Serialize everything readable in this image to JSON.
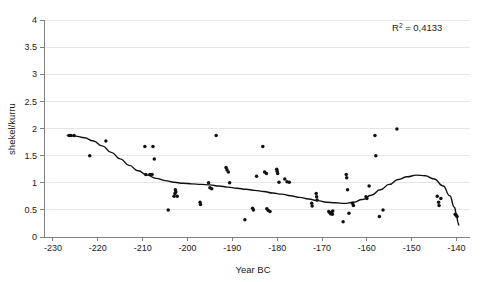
{
  "chart_data": {
    "type": "scatter",
    "title": "",
    "xlabel": "Year BC",
    "ylabel": "shekel/kurru",
    "xlim": [
      -232,
      -137
    ],
    "ylim": [
      0,
      4
    ],
    "xticks": [
      -230,
      -220,
      -210,
      -200,
      -190,
      -180,
      -170,
      -160,
      -150,
      -140
    ],
    "xtick_labels": [
      "-230",
      "-220",
      "-210",
      "-200",
      "-190",
      "-180",
      "-170",
      "-160",
      "-150",
      "-140"
    ],
    "yticks": [
      0,
      0.5,
      1,
      1.5,
      2,
      2.5,
      3,
      3.5,
      4
    ],
    "ytick_labels": [
      "0",
      "0.5",
      "1",
      "1.5",
      "2",
      "2.5",
      "3",
      "3.5",
      "4"
    ],
    "grid": "horizontal",
    "legend": "none",
    "annotations": [
      {
        "name": "r-squared",
        "text_prefix": "R",
        "text_sup": "2",
        "text_suffix": " = 0,4133",
        "full_text": "R2 = 0,4133",
        "value": 0.4133,
        "x": -152,
        "y": 3.72
      }
    ],
    "series": [
      {
        "name": "Barley price observations",
        "marker": "dot",
        "color": "#111111",
        "points": [
          [
            -226.4,
            1.87
          ],
          [
            -226.0,
            1.87
          ],
          [
            -225.3,
            1.87
          ],
          [
            -221.8,
            1.5
          ],
          [
            -218.2,
            1.77
          ],
          [
            -209.5,
            1.67
          ],
          [
            -207.7,
            1.67
          ],
          [
            -207.4,
            1.44
          ],
          [
            -209.3,
            1.15
          ],
          [
            -208.4,
            1.15
          ],
          [
            -207.9,
            1.15
          ],
          [
            -204.3,
            0.5
          ],
          [
            -202.7,
            0.87
          ],
          [
            -202.6,
            0.83
          ],
          [
            -202.8,
            0.8
          ],
          [
            -203.0,
            0.75
          ],
          [
            -202.3,
            0.75
          ],
          [
            -197.2,
            0.64
          ],
          [
            -197.1,
            0.6
          ],
          [
            -195.3,
            1.0
          ],
          [
            -195.0,
            0.91
          ],
          [
            -194.6,
            0.89
          ],
          [
            -193.6,
            1.87
          ],
          [
            -191.4,
            1.28
          ],
          [
            -191.2,
            1.24
          ],
          [
            -190.9,
            1.2
          ],
          [
            -190.6,
            1.0
          ],
          [
            -187.2,
            0.32
          ],
          [
            -185.5,
            0.53
          ],
          [
            -185.3,
            0.5
          ],
          [
            -184.6,
            1.12
          ],
          [
            -183.2,
            1.67
          ],
          [
            -182.8,
            1.2
          ],
          [
            -182.4,
            1.17
          ],
          [
            -182.3,
            0.52
          ],
          [
            -182.0,
            0.49
          ],
          [
            -181.6,
            0.47
          ],
          [
            -180.1,
            1.25
          ],
          [
            -180.0,
            1.21
          ],
          [
            -179.9,
            1.17
          ],
          [
            -179.6,
            1.01
          ],
          [
            -178.3,
            1.07
          ],
          [
            -177.8,
            1.02
          ],
          [
            -177.3,
            1.01
          ],
          [
            -172.3,
            0.62
          ],
          [
            -172.2,
            0.57
          ],
          [
            -171.3,
            0.8
          ],
          [
            -171.2,
            0.74
          ],
          [
            -171.1,
            0.68
          ],
          [
            -168.5,
            0.47
          ],
          [
            -168.3,
            0.45
          ],
          [
            -168.1,
            0.43
          ],
          [
            -167.9,
            0.45
          ],
          [
            -167.7,
            0.42
          ],
          [
            -167.6,
            0.48
          ],
          [
            -165.3,
            0.28
          ],
          [
            -164.6,
            1.15
          ],
          [
            -164.5,
            1.09
          ],
          [
            -164.3,
            0.87
          ],
          [
            -164.0,
            0.44
          ],
          [
            -163.2,
            0.62
          ],
          [
            -163.0,
            0.58
          ],
          [
            -160.2,
            0.74
          ],
          [
            -160.0,
            0.71
          ],
          [
            -159.5,
            0.94
          ],
          [
            -158.2,
            1.87
          ],
          [
            -158.0,
            1.5
          ],
          [
            -157.2,
            0.38
          ],
          [
            -156.4,
            0.5
          ],
          [
            -153.3,
            1.99
          ],
          [
            -144.3,
            0.75
          ],
          [
            -144.0,
            0.64
          ],
          [
            -143.9,
            0.58
          ],
          [
            -143.5,
            0.71
          ],
          [
            -140.3,
            0.42
          ],
          [
            -140.1,
            0.4
          ],
          [
            -139.9,
            0.38
          ]
        ]
      }
    ],
    "trendline": {
      "name": "Polynomial trend",
      "color": "#111111",
      "r_squared": 0.4133,
      "points": [
        [
          -226.8,
          1.87
        ],
        [
          -225.0,
          1.86
        ],
        [
          -223.0,
          1.83
        ],
        [
          -221.0,
          1.77
        ],
        [
          -219.0,
          1.68
        ],
        [
          -217.0,
          1.56
        ],
        [
          -215.0,
          1.44
        ],
        [
          -213.0,
          1.32
        ],
        [
          -211.0,
          1.22
        ],
        [
          -209.0,
          1.14
        ],
        [
          -207.0,
          1.08
        ],
        [
          -205.0,
          1.04
        ],
        [
          -203.0,
          1.01
        ],
        [
          -201.0,
          0.99
        ],
        [
          -199.0,
          0.98
        ],
        [
          -197.0,
          0.97
        ],
        [
          -195.0,
          0.96
        ],
        [
          -193.0,
          0.94
        ],
        [
          -191.0,
          0.92
        ],
        [
          -189.0,
          0.9
        ],
        [
          -187.0,
          0.88
        ],
        [
          -185.0,
          0.86
        ],
        [
          -183.0,
          0.84
        ],
        [
          -181.0,
          0.81
        ],
        [
          -179.0,
          0.79
        ],
        [
          -177.0,
          0.76
        ],
        [
          -175.0,
          0.73
        ],
        [
          -173.0,
          0.7
        ],
        [
          -171.0,
          0.67
        ],
        [
          -169.0,
          0.64
        ],
        [
          -167.0,
          0.63
        ],
        [
          -165.0,
          0.62
        ],
        [
          -163.0,
          0.64
        ],
        [
          -161.0,
          0.69
        ],
        [
          -159.0,
          0.77
        ],
        [
          -157.0,
          0.87
        ],
        [
          -155.0,
          0.97
        ],
        [
          -153.0,
          1.06
        ],
        [
          -151.0,
          1.11
        ],
        [
          -149.0,
          1.14
        ],
        [
          -147.0,
          1.13
        ],
        [
          -145.0,
          1.07
        ],
        [
          -143.0,
          0.94
        ],
        [
          -141.5,
          0.76
        ],
        [
          -140.5,
          0.55
        ],
        [
          -140.0,
          0.42
        ],
        [
          -139.7,
          0.27
        ],
        [
          -139.5,
          0.22
        ]
      ]
    }
  }
}
